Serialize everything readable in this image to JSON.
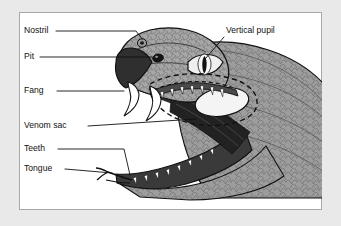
{
  "figure": {
    "frame": {
      "outer_background": "#e9e9e9",
      "panel_background": "#ffffff",
      "border_color": "#a8a8a8"
    },
    "palette": {
      "outline": "#111111",
      "scale_fill": "#9a9a9a",
      "scale_fill_light": "#b4b4b4",
      "mouth_dark": "#2b2b2b",
      "mouth_mid": "#4a4a4a",
      "tooth_white": "#ffffff",
      "venom_sac_fill": "#f2f2f2",
      "eye_iris": "#efefef",
      "pupil": "#111111"
    },
    "labels": [
      {
        "id": "nostril",
        "text": "Nostril",
        "x": 24,
        "y": 31,
        "anchor": "start"
      },
      {
        "id": "pit",
        "text": "Pit",
        "x": 24,
        "y": 57,
        "anchor": "start"
      },
      {
        "id": "fang",
        "text": "Fang",
        "x": 24,
        "y": 91,
        "anchor": "start"
      },
      {
        "id": "venom-sac",
        "text": "Venom sac",
        "x": 24,
        "y": 126,
        "anchor": "start"
      },
      {
        "id": "teeth",
        "text": "Teeth",
        "x": 24,
        "y": 149,
        "anchor": "start"
      },
      {
        "id": "tongue",
        "text": "Tongue",
        "x": 24,
        "y": 169,
        "anchor": "start"
      },
      {
        "id": "vertical-pupil",
        "text": "Vertical pupil",
        "x": 226,
        "y": 31,
        "anchor": "start"
      }
    ],
    "parts": [
      "head",
      "snout",
      "nostril",
      "pit",
      "eye",
      "vertical-pupil",
      "upper-fangs",
      "upper-teeth",
      "lower-teeth",
      "venom-sac",
      "tongue",
      "mouth-lining",
      "body-scales"
    ]
  }
}
